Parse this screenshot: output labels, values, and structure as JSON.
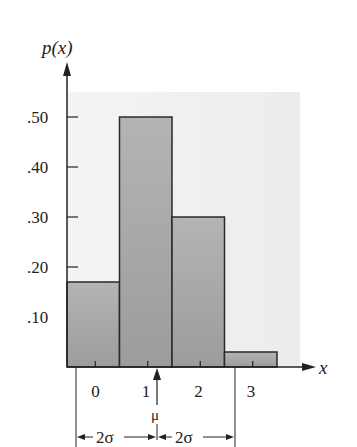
{
  "chart_data": {
    "type": "bar",
    "title": "",
    "ylabel": "p(x)",
    "xlabel": "x",
    "categories": [
      "0",
      "1",
      "2",
      "3"
    ],
    "values": [
      0.17,
      0.5,
      0.3,
      0.03
    ],
    "ylim": [
      0,
      0.55
    ],
    "yticks": [
      ".10",
      ".20",
      ".30",
      ".40",
      ".50"
    ],
    "grid": false,
    "legend": null,
    "annotations": {
      "mean_label": "μ",
      "mean_position": 1.6,
      "left_span_label": "2σ",
      "right_span_label": "2σ"
    },
    "colors": {
      "bar_fill": "#a8a8a8",
      "bar_stroke": "#2a2a2a",
      "background_panel": "#f0f0f0"
    }
  }
}
